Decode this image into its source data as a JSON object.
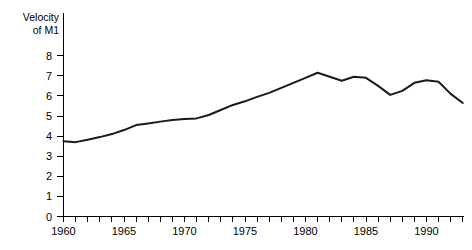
{
  "chart_data": {
    "type": "line",
    "title": "",
    "subtitle": "",
    "ylabel_line1": "Velocity",
    "ylabel_line2": "of M1",
    "xlabel": "",
    "ylim": [
      0,
      8
    ],
    "xlim": [
      1960,
      1993
    ],
    "grid": false,
    "legend": "none",
    "y_ticks": [
      0,
      1,
      2,
      3,
      4,
      5,
      6,
      7,
      8
    ],
    "y_tick_labels": [
      "0",
      "1",
      "2",
      "3",
      "4",
      "5",
      "6",
      "7",
      "8"
    ],
    "x_tick_years": [
      1960,
      1961,
      1962,
      1963,
      1964,
      1965,
      1966,
      1967,
      1968,
      1969,
      1970,
      1971,
      1972,
      1973,
      1974,
      1975,
      1976,
      1977,
      1978,
      1979,
      1980,
      1981,
      1982,
      1983,
      1984,
      1985,
      1986,
      1987,
      1988,
      1989,
      1990,
      1991,
      1992,
      1993
    ],
    "x_tick_labels": [
      "1960",
      "1965",
      "1970",
      "1975",
      "1980",
      "1985",
      "1990"
    ],
    "x_labeled_years": [
      1960,
      1965,
      1970,
      1975,
      1980,
      1985,
      1990
    ],
    "line_color": "#1a1a1a",
    "series": [
      {
        "name": "Velocity of M1",
        "x": [
          1960,
          1961,
          1962,
          1963,
          1964,
          1965,
          1966,
          1967,
          1968,
          1969,
          1970,
          1971,
          1972,
          1973,
          1974,
          1975,
          1976,
          1977,
          1978,
          1979,
          1980,
          1981,
          1982,
          1983,
          1984,
          1985,
          1986,
          1987,
          1988,
          1989,
          1990,
          1991,
          1992,
          1993
        ],
        "values": [
          3.75,
          3.7,
          3.82,
          3.95,
          4.1,
          4.3,
          4.55,
          4.63,
          4.72,
          4.8,
          4.85,
          4.88,
          5.05,
          5.3,
          5.55,
          5.73,
          5.95,
          6.15,
          6.4,
          6.65,
          6.9,
          7.15,
          6.95,
          6.75,
          6.95,
          6.9,
          6.5,
          6.05,
          6.25,
          6.65,
          6.78,
          6.7,
          6.1,
          5.65
        ]
      }
    ]
  }
}
